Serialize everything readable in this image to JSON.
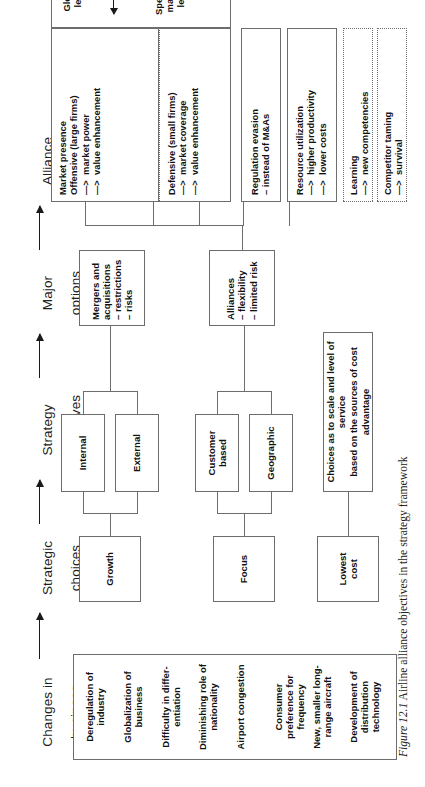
{
  "figure": {
    "number": "Figure 12.1",
    "caption": "Airline alliance objectives in the strategy framework",
    "orientation": "rotated-90-ccw"
  },
  "columns": [
    {
      "id": "changes-in-business",
      "line1": "Changes in",
      "line2": "business"
    },
    {
      "id": "strategic-choices",
      "line1": "Strategic",
      "line2": "choices"
    },
    {
      "id": "strategy-alternatives",
      "line1": "Strategy",
      "line2": "alternatives"
    },
    {
      "id": "major-options",
      "line1": "Major",
      "line2": "options"
    },
    {
      "id": "alliance-objectives",
      "line1": "Alliance",
      "line2": "objectives"
    }
  ],
  "changes_in_business": {
    "items": [
      "Deregulation of\nindustry",
      "Globalization of\nbusiness",
      "Difficulty in differ-\nentiation",
      "Diminishing role of\nnationality",
      "Airport congestion",
      "Consumer\npreference for\nfrequency",
      "New, smaller long-\nrange aircraft",
      "Development of\ndistribution\ntechnology"
    ]
  },
  "strategic_choices": [
    {
      "id": "growth",
      "label": "Growth"
    },
    {
      "id": "focus",
      "label": "Focus"
    },
    {
      "id": "lowest-cost",
      "label": "Lowest\ncost"
    }
  ],
  "strategy_alternatives": [
    {
      "id": "internal",
      "label": "Internal"
    },
    {
      "id": "external",
      "label": "External"
    },
    {
      "id": "customer-based",
      "label": "Customer\nbased"
    },
    {
      "id": "geographic",
      "label": "Geographic"
    },
    {
      "id": "cost-choices",
      "label": "Choices as to scale and level of service\nbased on the sources of cost advantage"
    }
  ],
  "major_options": [
    {
      "id": "mergers-and-acquisitions",
      "title": "Mergers and\nacquisitions",
      "bullets": [
        "– restrictions",
        "– risks"
      ]
    },
    {
      "id": "alliances",
      "title": "Alliances",
      "bullets": [
        "– flexibility",
        "– limited risk"
      ]
    }
  ],
  "alliance_objectives": [
    {
      "id": "market-presence",
      "style": "solid",
      "title": "Market presence",
      "groups": [
        {
          "subtitle": "Offensive (large firms)",
          "lines": [
            "—>  market power",
            "—>  value enhancement"
          ]
        },
        {
          "subtitle": "Defensive (small firms)",
          "lines": [
            "—>  market coverage",
            "—>  value enhancement"
          ]
        }
      ],
      "levels": {
        "left": "Global\nlevel",
        "right": "Specific\nmarket\nlevel",
        "arrow": "double-headed"
      }
    },
    {
      "id": "regulation-evasion",
      "style": "solid",
      "title": "Regulation evasion",
      "lines": [
        "– instead of M&As"
      ]
    },
    {
      "id": "resource-utilization",
      "style": "solid",
      "title": "Resource utilization",
      "lines": [
        "—>  higher productivity",
        "—>  lower costs"
      ]
    },
    {
      "id": "learning",
      "style": "dotted",
      "title": "Learning",
      "lines": [
        "—>  new competencies"
      ]
    },
    {
      "id": "competitor-taming",
      "style": "dotted",
      "title": "Competitor taming",
      "lines": [
        "—>  survival"
      ]
    }
  ],
  "colors": {
    "line": "#6d6d6d",
    "text": "#111111",
    "background": "#ffffff"
  }
}
